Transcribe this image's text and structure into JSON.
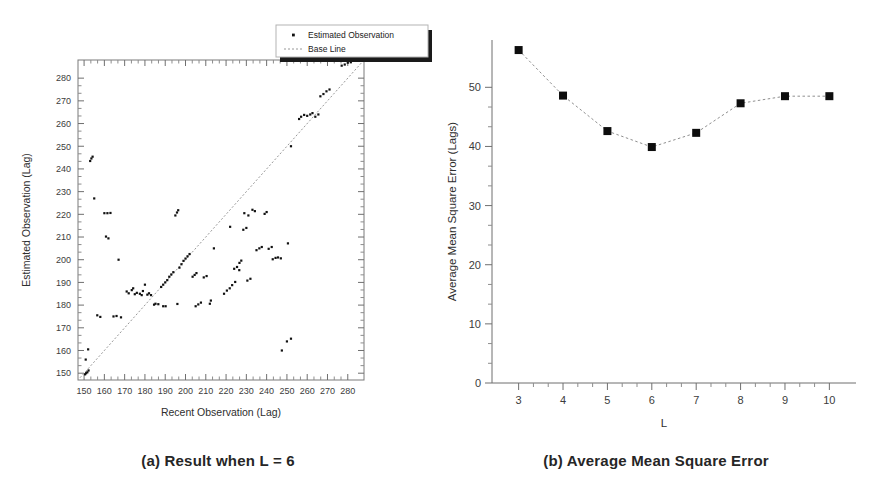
{
  "figure": {
    "panel_a_caption": "(a) Result when L = 6",
    "panel_b_caption": "(b) Average Mean Square Error"
  },
  "legend": {
    "items": [
      {
        "label": "Estimated Observation",
        "marker": "dot"
      },
      {
        "label": "Base Line",
        "marker": "dashed-line"
      }
    ]
  },
  "chart_data": [
    {
      "id": "panel-a",
      "type": "scatter",
      "title": "(a) Result when L = 6",
      "xlabel": "Recent Observation (Lag)",
      "ylabel": "Estimated Observation (Lag)",
      "xlim": [
        147,
        288
      ],
      "ylim": [
        147,
        288
      ],
      "xticks": [
        150,
        160,
        170,
        180,
        190,
        200,
        210,
        220,
        230,
        240,
        250,
        260,
        270,
        280
      ],
      "yticks": [
        150,
        160,
        170,
        180,
        190,
        200,
        210,
        220,
        230,
        240,
        250,
        260,
        270,
        280
      ],
      "minor_ticks_per_interval": 2,
      "grid": false,
      "legend_position": "top-right-outside",
      "series": [
        {
          "name": "Base Line",
          "type": "line",
          "style": "dashed",
          "points": [
            [
              148,
              148
            ],
            [
              287,
              287
            ]
          ]
        },
        {
          "name": "Estimated Observation",
          "type": "scatter",
          "points": [
            [
              150.5,
              149.5
            ],
            [
              151.0,
              150.0
            ],
            [
              151.6,
              150.4
            ],
            [
              152.2,
              151.2
            ],
            [
              150.8,
              156.0
            ],
            [
              152.0,
              160.5
            ],
            [
              153.0,
              243.5
            ],
            [
              153.6,
              244.6
            ],
            [
              154.2,
              245.4
            ],
            [
              155.0,
              227.0
            ],
            [
              156.5,
              175.5
            ],
            [
              158.0,
              174.8
            ],
            [
              160.0,
              220.5
            ],
            [
              161.5,
              220.5
            ],
            [
              163.0,
              220.6
            ],
            [
              160.8,
              210.2
            ],
            [
              162.0,
              209.4
            ],
            [
              164.5,
              175.0
            ],
            [
              166.0,
              175.2
            ],
            [
              168.2,
              174.6
            ],
            [
              167.0,
              200.0
            ],
            [
              171.0,
              186.0
            ],
            [
              172.0,
              185.2
            ],
            [
              173.5,
              186.6
            ],
            [
              174.2,
              187.4
            ],
            [
              175.0,
              184.8
            ],
            [
              176.0,
              185.4
            ],
            [
              177.5,
              185.0
            ],
            [
              178.4,
              184.4
            ],
            [
              179.0,
              186.2
            ],
            [
              180.0,
              189.0
            ],
            [
              181.2,
              184.6
            ],
            [
              182.0,
              185.2
            ],
            [
              183.0,
              184.4
            ],
            [
              184.5,
              180.2
            ],
            [
              185.2,
              180.6
            ],
            [
              186.6,
              180.4
            ],
            [
              188.0,
              188.0
            ],
            [
              189.0,
              189.0
            ],
            [
              190.0,
              190.0
            ],
            [
              191.0,
              191.0
            ],
            [
              192.0,
              192.5
            ],
            [
              193.0,
              193.5
            ],
            [
              194.0,
              194.5
            ],
            [
              195.0,
              219.5
            ],
            [
              195.8,
              220.8
            ],
            [
              196.4,
              221.8
            ],
            [
              197.0,
              196.5
            ],
            [
              198.0,
              198.0
            ],
            [
              199.0,
              199.5
            ],
            [
              200.0,
              200.5
            ],
            [
              201.0,
              201.5
            ],
            [
              202.0,
              202.5
            ],
            [
              189.0,
              179.5
            ],
            [
              190.2,
              179.5
            ],
            [
              196.0,
              180.5
            ],
            [
              203.5,
              192.5
            ],
            [
              204.5,
              193.3
            ],
            [
              205.4,
              194.1
            ],
            [
              205.0,
              179.5
            ],
            [
              206.3,
              180.3
            ],
            [
              207.6,
              181.1
            ],
            [
              209.0,
              192.2
            ],
            [
              210.4,
              192.8
            ],
            [
              212.0,
              180.6
            ],
            [
              214.0,
              205.0
            ],
            [
              212.5,
              182.0
            ],
            [
              219.0,
              185.0
            ],
            [
              220.4,
              186.4
            ],
            [
              221.8,
              187.4
            ],
            [
              223.0,
              188.8
            ],
            [
              224.5,
              190.2
            ],
            [
              222.0,
              214.5
            ],
            [
              224.0,
              196.0
            ],
            [
              225.4,
              196.8
            ],
            [
              226.6,
              198.6
            ],
            [
              227.5,
              199.6
            ],
            [
              228.5,
              213.2
            ],
            [
              230.0,
              214.0
            ],
            [
              229.0,
              220.5
            ],
            [
              226.5,
              195.4
            ],
            [
              230.5,
              190.8
            ],
            [
              232.0,
              191.6
            ],
            [
              231.0,
              219.5
            ],
            [
              233.0,
              222.0
            ],
            [
              234.2,
              221.4
            ],
            [
              235.0,
              204.2
            ],
            [
              236.4,
              205.0
            ],
            [
              237.6,
              205.6
            ],
            [
              239.0,
              220.2
            ],
            [
              240.0,
              221.0
            ],
            [
              241.0,
              204.8
            ],
            [
              242.5,
              205.6
            ],
            [
              243.0,
              200.2
            ],
            [
              244.4,
              200.8
            ],
            [
              245.6,
              201.0
            ],
            [
              247.0,
              200.6
            ],
            [
              250.5,
              207.2
            ],
            [
              250.0,
              164.0
            ],
            [
              252.0,
              165.2
            ],
            [
              247.5,
              160.0
            ],
            [
              252.0,
              250.0
            ],
            [
              256.0,
              262.0
            ],
            [
              257.0,
              263.0
            ],
            [
              258.5,
              263.8
            ],
            [
              260.0,
              263.4
            ],
            [
              261.5,
              264.0
            ],
            [
              262.6,
              264.6
            ],
            [
              264.0,
              263.0
            ],
            [
              265.5,
              264.0
            ],
            [
              266.5,
              272.0
            ],
            [
              268.0,
              273.0
            ],
            [
              269.5,
              274.2
            ],
            [
              271.0,
              275.0
            ],
            [
              277.0,
              285.5
            ],
            [
              278.5,
              286.0
            ],
            [
              280.0,
              286.8
            ],
            [
              281.5,
              287.0
            ]
          ]
        }
      ]
    },
    {
      "id": "panel-b",
      "type": "line",
      "title": "(b) Average Mean Square Error",
      "xlabel": "L",
      "ylabel": "Average Mean Square Error (Lags)",
      "xlim": [
        2.4,
        10.6
      ],
      "ylim": [
        0,
        58
      ],
      "xticks": [
        3,
        4,
        5,
        6,
        7,
        8,
        9,
        10
      ],
      "yticks": [
        0,
        10,
        20,
        30,
        40,
        50
      ],
      "minor_ticks_per_interval": 2,
      "grid": false,
      "marker": "square",
      "line_style": "dotted",
      "categories": [
        3,
        4,
        5,
        6,
        7,
        8,
        9,
        10
      ],
      "values": [
        56.3,
        48.6,
        42.6,
        39.9,
        42.3,
        47.3,
        48.5,
        48.5
      ]
    }
  ]
}
